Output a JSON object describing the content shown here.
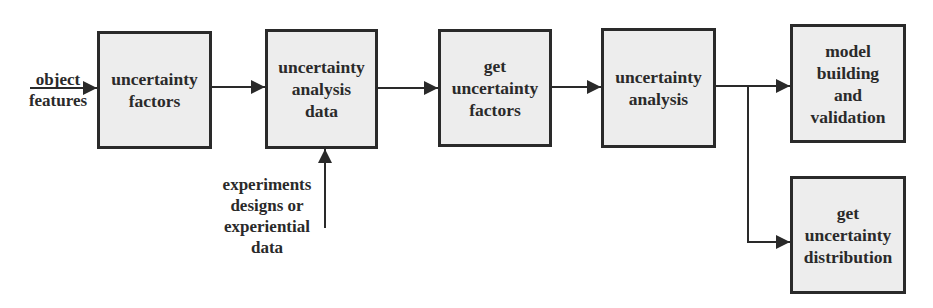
{
  "diagram": {
    "type": "flowchart",
    "direction": "left-to-right",
    "inputs": {
      "object_features": "object\nfeatures",
      "experiments": "experiments\ndesigns or\nexperiential\ndata"
    },
    "nodes": [
      {
        "id": "n1",
        "label": "uncertainty\nfactors"
      },
      {
        "id": "n2",
        "label": "uncertainty\nanalysis\ndata"
      },
      {
        "id": "n3",
        "label": "get\nuncertainty\nfactors"
      },
      {
        "id": "n4",
        "label": "uncertainty\nanalysis"
      },
      {
        "id": "n5",
        "label": "model\nbuilding\nand\nvalidation"
      },
      {
        "id": "n6",
        "label": "get\nuncertainty\ndistribution"
      }
    ],
    "edges": [
      {
        "from": "object_features",
        "to": "n1"
      },
      {
        "from": "n1",
        "to": "n2"
      },
      {
        "from": "experiments",
        "to": "n2"
      },
      {
        "from": "n2",
        "to": "n3"
      },
      {
        "from": "n3",
        "to": "n4"
      },
      {
        "from": "n4",
        "to": "n5"
      },
      {
        "from": "n4",
        "to": "n6"
      }
    ],
    "colors": {
      "stroke": "#2a2a2a",
      "box_fill": "#ededed",
      "background": "#ffffff"
    }
  }
}
